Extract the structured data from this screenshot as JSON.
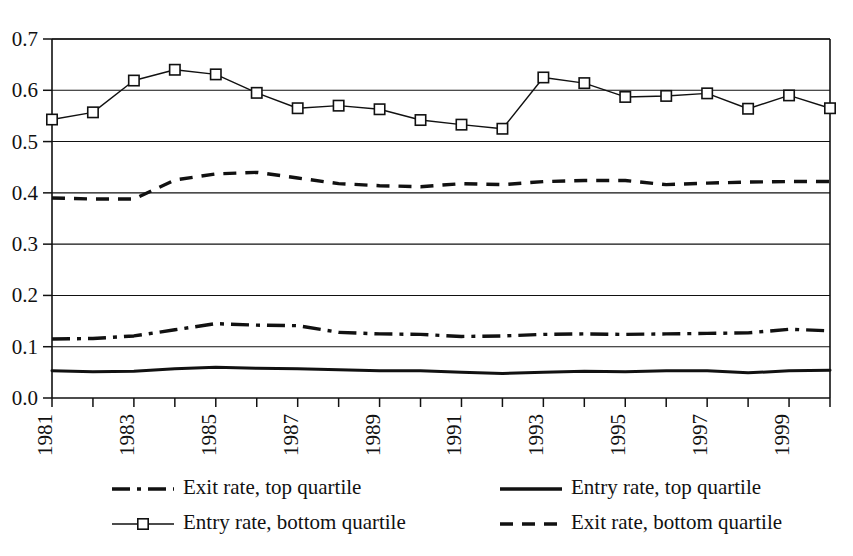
{
  "chart_data": {
    "type": "line",
    "title": "",
    "subtitle": "",
    "xlabel": "",
    "ylabel": "",
    "xlim": [
      1981,
      2000
    ],
    "ylim": [
      0.0,
      0.7
    ],
    "grid": "horizontal",
    "legend_position": "bottom",
    "x": [
      1981,
      1982,
      1983,
      1984,
      1985,
      1986,
      1987,
      1988,
      1989,
      1990,
      1991,
      1992,
      1993,
      1994,
      1995,
      1996,
      1997,
      1998,
      1999,
      2000
    ],
    "xtick_labels": [
      "1981",
      "1983",
      "1985",
      "1987",
      "1989",
      "1991",
      "1993",
      "1995",
      "1997",
      "1999"
    ],
    "xtick_values": [
      1981,
      1983,
      1985,
      1987,
      1989,
      1991,
      1993,
      1995,
      1997,
      1999
    ],
    "ytick_labels": [
      "0.0",
      "0.1",
      "0.2",
      "0.3",
      "0.4",
      "0.5",
      "0.6",
      "0.7"
    ],
    "ytick_values": [
      0.0,
      0.1,
      0.2,
      0.3,
      0.4,
      0.5,
      0.6,
      0.7
    ],
    "series": [
      {
        "name": "Entry rate, bottom quartile",
        "style": "solid-marker",
        "marker": "square",
        "stroke_width": 1.4,
        "values": [
          0.543,
          0.557,
          0.619,
          0.64,
          0.631,
          0.595,
          0.565,
          0.57,
          0.563,
          0.542,
          0.533,
          0.525,
          0.625,
          0.614,
          0.587,
          0.589,
          0.594,
          0.564,
          0.59,
          0.565
        ]
      },
      {
        "name": "Exit rate, bottom quartile",
        "style": "dashed",
        "marker": "none",
        "stroke_width": 3.4,
        "values": [
          0.39,
          0.388,
          0.388,
          0.425,
          0.437,
          0.44,
          0.429,
          0.418,
          0.414,
          0.412,
          0.418,
          0.416,
          0.422,
          0.424,
          0.424,
          0.416,
          0.419,
          0.421,
          0.422,
          0.422
        ]
      },
      {
        "name": "Exit rate, top quartile",
        "style": "dash-dot",
        "marker": "none",
        "stroke_width": 3.4,
        "values": [
          0.115,
          0.116,
          0.121,
          0.133,
          0.145,
          0.142,
          0.141,
          0.128,
          0.125,
          0.124,
          0.12,
          0.121,
          0.124,
          0.125,
          0.124,
          0.125,
          0.126,
          0.127,
          0.134,
          0.131
        ]
      },
      {
        "name": "Entry rate, top quartile",
        "style": "solid",
        "marker": "none",
        "stroke_width": 3.0,
        "values": [
          0.053,
          0.051,
          0.052,
          0.057,
          0.06,
          0.058,
          0.057,
          0.055,
          0.053,
          0.053,
          0.05,
          0.048,
          0.05,
          0.052,
          0.051,
          0.053,
          0.053,
          0.049,
          0.053,
          0.054
        ]
      }
    ]
  },
  "legend": {
    "entries": [
      {
        "label": "Exit rate, top quartile",
        "style": "dash-dot"
      },
      {
        "label": "Entry rate, top quartile",
        "style": "solid"
      },
      {
        "label": "Entry rate, bottom quartile",
        "style": "solid-marker"
      },
      {
        "label": "Exit rate, bottom quartile",
        "style": "dashed"
      }
    ]
  },
  "colors": {
    "ink": "#111111",
    "background": "#ffffff"
  }
}
